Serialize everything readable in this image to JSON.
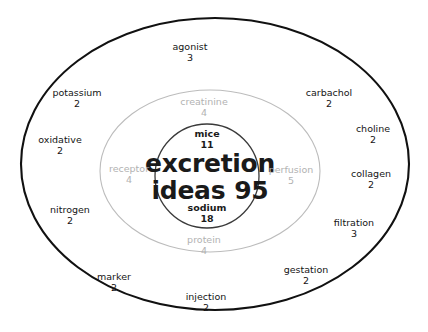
{
  "figure": {
    "type": "concentric-bubble-term-map",
    "background_color": "#ffffff",
    "core": {
      "term": "excretion",
      "label": "ideas",
      "count": "95"
    },
    "rings": [
      {
        "name": "inner-circle",
        "stroke_color": "#333333",
        "text_color": "#1a1a1a",
        "terms": [
          {
            "term": "mice",
            "count": "11"
          },
          {
            "term": "sodium",
            "count": "18"
          }
        ]
      },
      {
        "name": "middle-ellipse",
        "stroke_color": "#b9b9b9",
        "text_color": "#b2b2b2",
        "terms": [
          {
            "term": "creatinine",
            "count": "4"
          },
          {
            "term": "receptor",
            "count": "4"
          },
          {
            "term": "perfusion",
            "count": "5"
          },
          {
            "term": "protein",
            "count": "4"
          }
        ]
      },
      {
        "name": "outer-ellipse",
        "stroke_color": "#111111",
        "text_color": "#151515",
        "terms": [
          {
            "term": "agonist",
            "count": "3"
          },
          {
            "term": "potassium",
            "count": "2"
          },
          {
            "term": "carbachol",
            "count": "2"
          },
          {
            "term": "oxidative",
            "count": "2"
          },
          {
            "term": "choline",
            "count": "2"
          },
          {
            "term": "collagen",
            "count": "2"
          },
          {
            "term": "nitrogen",
            "count": "2"
          },
          {
            "term": "filtration",
            "count": "3"
          },
          {
            "term": "marker",
            "count": "2"
          },
          {
            "term": "gestation",
            "count": "2"
          },
          {
            "term": "injection",
            "count": "2"
          }
        ]
      }
    ]
  }
}
